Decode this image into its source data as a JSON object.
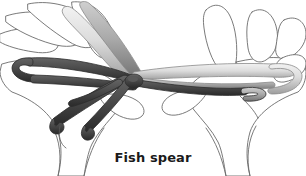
{
  "figure": {
    "title": "Fish spear",
    "background_color": "#ffffff",
    "caption": {
      "text": "Fish spear",
      "color": "#1a1a1a",
      "position": "bottom-center"
    },
    "palette": {
      "outline": "#6b6b6b",
      "hand_fill": "#ffffff",
      "string_dark": "#4a4a4a",
      "string_dark_edge": "#2c2c2c",
      "string_light": "#d8d8d8",
      "string_light_edge": "#8a8a8a",
      "string_mid": "#9a9a9a",
      "caption_color": "#1a1a1a"
    },
    "elements": {
      "left_hand_label": "left hand, palm up, fingers spread",
      "right_hand_label": "right hand, palm up, fingers spread",
      "dark_strings_label": "dark string loops",
      "light_strings_label": "light string loops",
      "crossing_label": "central string crossing",
      "prongs_label": "fish spear prongs"
    }
  }
}
